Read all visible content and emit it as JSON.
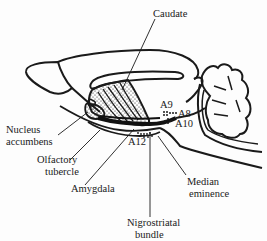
{
  "diagram": {
    "labels": {
      "caudate": "Caudate",
      "nucleus_accumbens_line1": "Nucleus",
      "nucleus_accumbens_line2": "accumbens",
      "olfactory_tubercle_line1": "Olfactory",
      "olfactory_tubercle_line2": "tubercle",
      "amygdala": "Amygdala",
      "nigrostriatal_bundle_line1": "Nigrostriatal",
      "nigrostriatal_bundle_line2": "bundle",
      "median_eminence_line1": "Median",
      "median_eminence_line2": "eminence",
      "a9": "A9",
      "a8": "A8",
      "a10": "A10",
      "a12": "A12"
    },
    "colors": {
      "ink": "#1a1a1a",
      "background": "#fdfdfd"
    }
  }
}
